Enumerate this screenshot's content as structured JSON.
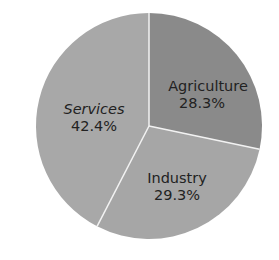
{
  "chart_data": {
    "type": "pie",
    "title": "",
    "categories": [
      "Agriculture",
      "Industry",
      "Services"
    ],
    "values": [
      28.3,
      29.3,
      42.4
    ],
    "unit": "%",
    "start_angle_deg": 0,
    "direction": "clockwise",
    "legend": "none (labels inside slices)",
    "colors": [
      "#8a8a8a",
      "#a6a6a6",
      "#a8a8a8"
    ],
    "separator_color": "#f2f2f2"
  },
  "labels": {
    "agriculture": {
      "name": "Agriculture",
      "value": "28.3%"
    },
    "industry": {
      "name": "Industry",
      "value": "29.3%"
    },
    "services": {
      "name": "Services",
      "value": "42.4%"
    }
  }
}
